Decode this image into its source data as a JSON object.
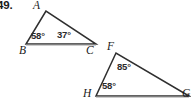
{
  "problem": {
    "number": "49."
  },
  "colors": {
    "stroke": "#2f2f2f",
    "stroke_light": "#8a8a8a",
    "text": "#1a1a1a",
    "angle_text": "#2b2b2b",
    "background": "#ffffff"
  },
  "figure": {
    "type": "two-triangles",
    "triangles": [
      {
        "id": "triangle-abc",
        "vertices": [
          {
            "name": "A",
            "label": "A",
            "x": 46,
            "y": 11,
            "label_x": 33,
            "label_y": 0
          },
          {
            "name": "B",
            "label": "B",
            "x": 26,
            "y": 44,
            "label_x": 19,
            "label_y": 45
          },
          {
            "name": "C",
            "label": "C",
            "x": 96,
            "y": 44,
            "label_x": 86,
            "label_y": 45
          }
        ],
        "angles": [
          {
            "at": "B",
            "value": "58°",
            "label_x": 31,
            "label_y": 31
          },
          {
            "at": "C",
            "value": "37°",
            "label_x": 57,
            "label_y": 30
          }
        ]
      },
      {
        "id": "triangle-fhg",
        "vertices": [
          {
            "name": "F",
            "label": "F",
            "x": 116,
            "y": 53,
            "label_x": 107,
            "label_y": 41
          },
          {
            "name": "H",
            "label": "H",
            "x": 96,
            "y": 96,
            "label_x": 83,
            "label_y": 88
          },
          {
            "name": "G",
            "label": "G",
            "x": 189,
            "y": 96,
            "label_x": 182,
            "label_y": 88
          }
        ],
        "angles": [
          {
            "at": "F",
            "value": "85°",
            "label_x": 117,
            "label_y": 62
          },
          {
            "at": "H",
            "value": "58°",
            "label_x": 102,
            "label_y": 81
          }
        ]
      }
    ]
  }
}
